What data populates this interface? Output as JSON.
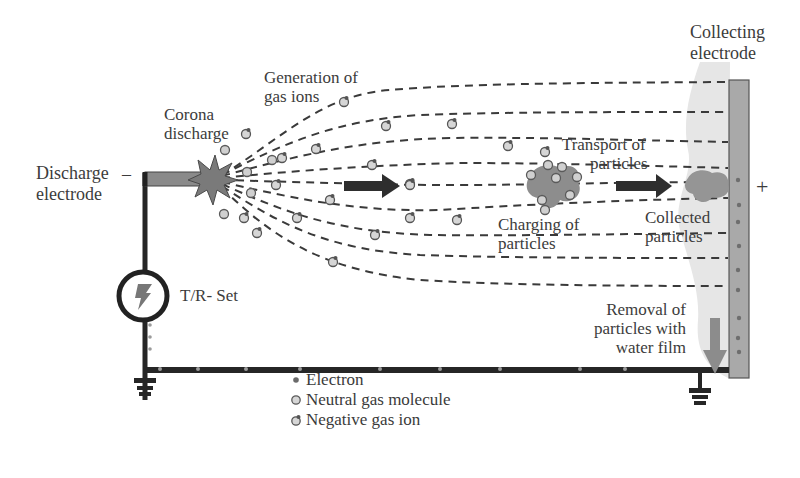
{
  "diagram": {
    "labels": {
      "collecting_electrode": "Collecting\nelectrode",
      "collecting_electrode_line1": "Collecting",
      "collecting_electrode_line2": "electrode",
      "generation_line1": "Generation of",
      "generation_line2": "gas ions",
      "corona_line1": "Corona",
      "corona_line2": "discharge",
      "discharge_line1": "Discharge",
      "discharge_line2": "electrode",
      "minus_sign": "–",
      "plus_sign": "+",
      "transport_line1": "Transport of",
      "transport_line2": "particles",
      "charging_line1": "Charging of",
      "charging_line2": "particles",
      "collected_line1": "Collected",
      "collected_line2": "particles",
      "tr_set": "T/R- Set",
      "removal_line1": "Removal of",
      "removal_line2": "particles with",
      "removal_line3": "water film"
    },
    "legend": [
      {
        "symbol": "electron",
        "label": "Electron"
      },
      {
        "symbol": "neutral-gas-molecule",
        "label": "Neutral gas molecule"
      },
      {
        "symbol": "negative-gas-ion",
        "label": "Negative gas ion"
      }
    ],
    "colors": {
      "wire": "#2b2b2b",
      "electrode_plate": "#a9a9a9",
      "discharge_rod": "#8a8a8a",
      "corona_star": "#7d7d7d",
      "particle": "#8f8f8f",
      "water_film": "#e4e4e4",
      "arrow_dark": "#2e2e2e",
      "arrow_gray": "#8c8c8c",
      "text": "#3c3c3c"
    }
  }
}
